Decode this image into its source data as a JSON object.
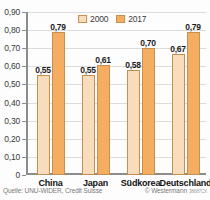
{
  "chart_data": {
    "type": "bar",
    "title": "",
    "xlabel": "",
    "ylabel": "",
    "categories": [
      "China",
      "Japan",
      "Südkorea",
      "Deutschland"
    ],
    "series": [
      {
        "name": "2000",
        "color": "#f8ddbd",
        "values": [
          0.55,
          0.55,
          0.58,
          0.67
        ],
        "labels": [
          "0,55",
          "0,55",
          "0,58",
          "0,67"
        ]
      },
      {
        "name": "2017",
        "color": "#f5ad62",
        "values": [
          0.79,
          0.61,
          0.7,
          0.79
        ],
        "labels": [
          "0,79",
          "0,61",
          "0,70",
          "0,79"
        ]
      }
    ],
    "ylim": [
      0,
      0.9
    ],
    "ytick_values": [
      0.9,
      0.8,
      0.7,
      0.6,
      0.5,
      0.4,
      0.3,
      0.2,
      0.1,
      0
    ],
    "ytick_labels": [
      "0,90",
      "0,80",
      "0,70",
      "0,60",
      "0,50",
      "0,40",
      "0,30",
      "0,20",
      "0,10",
      "0"
    ],
    "grid": true,
    "legend_position": "top-center"
  },
  "legend": {
    "items": [
      {
        "label": "2000",
        "color": "#f8ddbd"
      },
      {
        "label": "2017",
        "color": "#f5ad62"
      }
    ]
  },
  "footer": {
    "source": "Quelle: UNU-WIDER, Credit Suisse",
    "copyright": "© Westermann",
    "copyright_code": "38687CX"
  },
  "colors": {
    "series_2000": "#f8ddbd",
    "series_2017": "#f5ad62",
    "bar_outline": "#c58f52",
    "axis": "#8c8c8c",
    "grid": "#dcdcdc",
    "background": "#fdfdfd"
  }
}
